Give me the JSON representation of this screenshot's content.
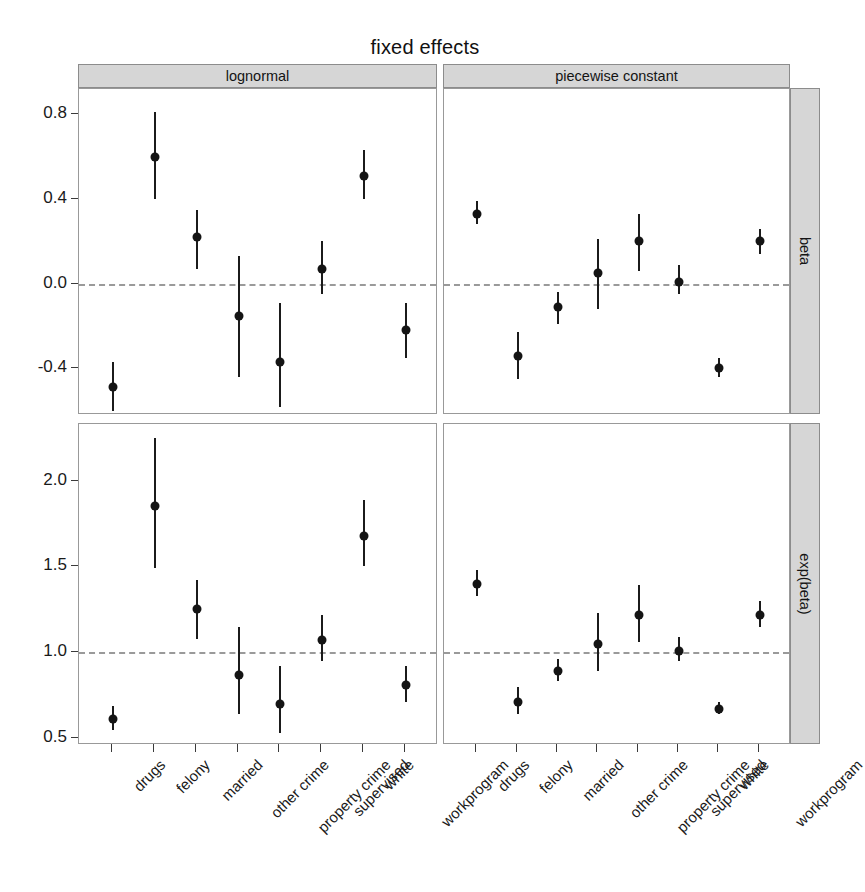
{
  "chart_data": {
    "type": "scatter",
    "title": "fixed effects",
    "subtitle": "",
    "xlabel": "",
    "ylabel": "",
    "grid": false,
    "legend": "none",
    "layout": "2x2 lattice (trellis) of dotplots with 95% confidence intervals",
    "column_facets": [
      "lognormal",
      "piecewise constant"
    ],
    "row_facets": [
      "beta",
      "exp(beta)"
    ],
    "categories": [
      "drugs",
      "felony",
      "married",
      "other crime",
      "property crime",
      "supervised",
      "white",
      "workprogram"
    ],
    "rows": [
      {
        "row_label": "beta",
        "ylim": [
          -0.62,
          0.92
        ],
        "yticks": [
          -0.4,
          0.0,
          0.4,
          0.8
        ],
        "yticklabels": [
          "-0.4",
          "0.0",
          "0.4",
          "0.8"
        ],
        "refline": 0.0,
        "panels": [
          {
            "column_label": "lognormal",
            "series": [
              {
                "name": "drugs",
                "value": -0.49,
                "lower": -0.6,
                "upper": -0.37
              },
              {
                "name": "felony",
                "value": 0.6,
                "lower": 0.4,
                "upper": 0.81
              },
              {
                "name": "married",
                "value": 0.22,
                "lower": 0.07,
                "upper": 0.35
              },
              {
                "name": "other crime",
                "value": -0.15,
                "lower": -0.44,
                "upper": 0.13
              },
              {
                "name": "property crime",
                "value": -0.37,
                "lower": -0.58,
                "upper": -0.09
              },
              {
                "name": "supervised",
                "value": 0.07,
                "lower": -0.05,
                "upper": 0.2
              },
              {
                "name": "white",
                "value": 0.51,
                "lower": 0.4,
                "upper": 0.63
              },
              {
                "name": "workprogram",
                "value": -0.22,
                "lower": -0.35,
                "upper": -0.09
              }
            ]
          },
          {
            "column_label": "piecewise constant",
            "series": [
              {
                "name": "drugs",
                "value": 0.33,
                "lower": 0.28,
                "upper": 0.39
              },
              {
                "name": "felony",
                "value": -0.34,
                "lower": -0.45,
                "upper": -0.23
              },
              {
                "name": "married",
                "value": -0.11,
                "lower": -0.19,
                "upper": -0.04
              },
              {
                "name": "other crime",
                "value": 0.05,
                "lower": -0.12,
                "upper": 0.21
              },
              {
                "name": "property crime",
                "value": 0.2,
                "lower": 0.06,
                "upper": 0.33
              },
              {
                "name": "supervised",
                "value": 0.01,
                "lower": -0.05,
                "upper": 0.09
              },
              {
                "name": "white",
                "value": -0.4,
                "lower": -0.44,
                "upper": -0.35
              },
              {
                "name": "workprogram",
                "value": 0.2,
                "lower": 0.14,
                "upper": 0.26
              }
            ]
          }
        ]
      },
      {
        "row_label": "exp(beta)",
        "ylim": [
          0.46,
          2.33
        ],
        "yticks": [
          0.5,
          1.0,
          1.5,
          2.0
        ],
        "yticklabels": [
          "0.5",
          "1.0",
          "1.5",
          "2.0"
        ],
        "refline": 1.0,
        "panels": [
          {
            "column_label": "lognormal",
            "series": [
              {
                "name": "drugs",
                "value": 0.61,
                "lower": 0.55,
                "upper": 0.69
              },
              {
                "name": "felony",
                "value": 1.85,
                "lower": 1.49,
                "upper": 2.25
              },
              {
                "name": "married",
                "value": 1.25,
                "lower": 1.08,
                "upper": 1.42
              },
              {
                "name": "other crime",
                "value": 0.87,
                "lower": 0.64,
                "upper": 1.15
              },
              {
                "name": "property crime",
                "value": 0.7,
                "lower": 0.53,
                "upper": 0.92
              },
              {
                "name": "supervised",
                "value": 1.07,
                "lower": 0.95,
                "upper": 1.22
              },
              {
                "name": "white",
                "value": 1.68,
                "lower": 1.5,
                "upper": 1.89
              },
              {
                "name": "workprogram",
                "value": 0.81,
                "lower": 0.71,
                "upper": 0.92
              }
            ]
          },
          {
            "column_label": "piecewise constant",
            "series": [
              {
                "name": "drugs",
                "value": 1.4,
                "lower": 1.33,
                "upper": 1.48
              },
              {
                "name": "felony",
                "value": 0.71,
                "lower": 0.64,
                "upper": 0.8
              },
              {
                "name": "married",
                "value": 0.89,
                "lower": 0.83,
                "upper": 0.96
              },
              {
                "name": "other crime",
                "value": 1.05,
                "lower": 0.89,
                "upper": 1.23
              },
              {
                "name": "property crime",
                "value": 1.22,
                "lower": 1.06,
                "upper": 1.39
              },
              {
                "name": "supervised",
                "value": 1.01,
                "lower": 0.95,
                "upper": 1.09
              },
              {
                "name": "white",
                "value": 0.67,
                "lower": 0.64,
                "upper": 0.71
              },
              {
                "name": "workprogram",
                "value": 1.22,
                "lower": 1.15,
                "upper": 1.3
              }
            ]
          }
        ]
      }
    ]
  },
  "colors": {
    "strip_background": "#d6d6d6",
    "strip_border": "#8c8c8c",
    "panel_border": "#999999",
    "point": "#141414",
    "interval": "#1b1b1b",
    "reference_line": "#9a9a9a",
    "text": "#1a1a1a",
    "background": "#ffffff"
  }
}
